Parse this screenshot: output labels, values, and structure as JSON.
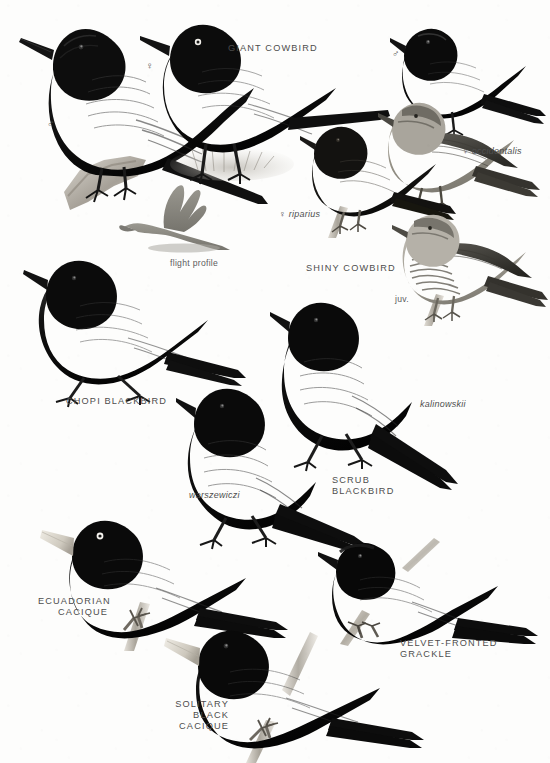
{
  "plate": {
    "kind": "field-guide-illustration-plate",
    "subject_group": "New World blackbirds, cowbirds, caciques and grackles",
    "background_color": "#fdfdfc",
    "ink_color": "#111111",
    "label_color": "#4d4d4d",
    "width": 550,
    "height": 763
  },
  "labels": [
    {
      "id": "giant-cowbird",
      "text": "GIANT COWBIRD",
      "style": "species",
      "align": "left",
      "x": 228,
      "y": 43
    },
    {
      "id": "giant-cowbird-male",
      "text": "♂",
      "style": "sym",
      "align": "left",
      "x": 47,
      "y": 118
    },
    {
      "id": "giant-cowbird-female",
      "text": "♀",
      "style": "sym",
      "align": "left",
      "x": 146,
      "y": 60
    },
    {
      "id": "flight-profile",
      "text": "flight profile",
      "style": "note",
      "align": "left",
      "x": 170,
      "y": 258
    },
    {
      "id": "shiny-cowbird",
      "text": "SHINY COWBIRD",
      "style": "species",
      "align": "left",
      "x": 306,
      "y": 263
    },
    {
      "id": "shiny-cowbird-male",
      "text": "♂",
      "style": "sym",
      "align": "left",
      "x": 392,
      "y": 48
    },
    {
      "id": "occidentalis",
      "text": "♀  occidentalis",
      "style": "subspecies",
      "align": "left",
      "x": 462,
      "y": 146
    },
    {
      "id": "riparius",
      "text": "♀  riparius",
      "style": "subspecies",
      "align": "left",
      "x": 279,
      "y": 209
    },
    {
      "id": "juvenile",
      "text": "juv.",
      "style": "note",
      "align": "left",
      "x": 395,
      "y": 294
    },
    {
      "id": "chopi-blackbird",
      "text": "CHOPI BLACKBIRD",
      "style": "species",
      "align": "left",
      "x": 66,
      "y": 396
    },
    {
      "id": "warszewiczi",
      "text": "warszewiczi",
      "style": "subspecies",
      "align": "left",
      "x": 189,
      "y": 490
    },
    {
      "id": "kalinowskii",
      "text": "kalinowskii",
      "style": "subspecies",
      "align": "left",
      "x": 420,
      "y": 399
    },
    {
      "id": "scrub-blackbird",
      "text": "SCRUB\nBLACKBIRD",
      "style": "species",
      "align": "left",
      "x": 332,
      "y": 475
    },
    {
      "id": "ecuadorian-cacique",
      "text": "ECUADORIAN\nCACIQUE",
      "style": "species",
      "align": "right",
      "x": 38,
      "y": 596,
      "w": 70
    },
    {
      "id": "solitary-black-cacique",
      "text": "SOLITARY BLACK\nCACIQUE",
      "style": "species",
      "align": "right",
      "x": 140,
      "y": 699,
      "w": 89
    },
    {
      "id": "velvet-fronted-grackle",
      "text": "VELVET-FRONTED\nGRACKLE",
      "style": "species",
      "align": "left",
      "x": 400,
      "y": 638
    }
  ],
  "birds": [
    {
      "id": "giant-cowbird-male-figure",
      "name": "Giant Cowbird male",
      "pose": "perched on branch, ruffed nape, long tail",
      "x": 18,
      "y": 12,
      "w": 240,
      "h": 210
    },
    {
      "id": "giant-cowbird-female-figure",
      "name": "Giant Cowbird female",
      "pose": "walking on ground, long tail",
      "x": 142,
      "y": 16,
      "w": 230,
      "h": 180
    },
    {
      "id": "flight-profile-figure",
      "name": "Giant Cowbird flight profile",
      "pose": "grey silhouette in flight",
      "x": 120,
      "y": 185,
      "w": 110,
      "h": 72
    },
    {
      "id": "shiny-cowbird-male-figure",
      "name": "Shiny Cowbird male",
      "pose": "perched, glossy black",
      "x": 392,
      "y": 22,
      "w": 150,
      "h": 118
    },
    {
      "id": "shiny-cowbird-occidentalis",
      "name": "Shiny Cowbird female occidentalis",
      "pose": "perched, pale greyish-brown",
      "x": 378,
      "y": 98,
      "w": 160,
      "h": 110
    },
    {
      "id": "shiny-cowbird-riparius",
      "name": "Shiny Cowbird female riparius",
      "pose": "perched on stem, dark brown",
      "x": 300,
      "y": 120,
      "w": 150,
      "h": 112
    },
    {
      "id": "shiny-cowbird-juvenile",
      "name": "Shiny Cowbird juvenile",
      "pose": "perched on stem, streaked underparts",
      "x": 392,
      "y": 210,
      "w": 152,
      "h": 110
    },
    {
      "id": "chopi-blackbird-figure",
      "name": "Chopi Blackbird",
      "pose": "walking on ground, long tail",
      "x": 24,
      "y": 255,
      "w": 215,
      "h": 150
    },
    {
      "id": "scrub-blackbird-kalinowskii",
      "name": "Scrub Blackbird kalinowskii",
      "pose": "standing, long graduated tail",
      "x": 272,
      "y": 290,
      "w": 200,
      "h": 200
    },
    {
      "id": "scrub-blackbird-warszewiczi",
      "name": "Scrub Blackbird warszewiczi",
      "pose": "standing, long graduated tail",
      "x": 178,
      "y": 380,
      "w": 200,
      "h": 165
    },
    {
      "id": "ecuadorian-cacique-figure",
      "name": "Ecuadorian Cacique",
      "pose": "perched on stem, pale bill, white eye",
      "x": 40,
      "y": 518,
      "w": 245,
      "h": 130
    },
    {
      "id": "solitary-black-cacique-figure",
      "name": "Solitary Black Cacique",
      "pose": "perched on stem, pale bill",
      "x": 165,
      "y": 630,
      "w": 255,
      "h": 135
    },
    {
      "id": "velvet-fronted-grackle-figure",
      "name": "Velvet-fronted Grackle",
      "pose": "perched on twig, long tail",
      "x": 320,
      "y": 540,
      "w": 215,
      "h": 115
    }
  ]
}
